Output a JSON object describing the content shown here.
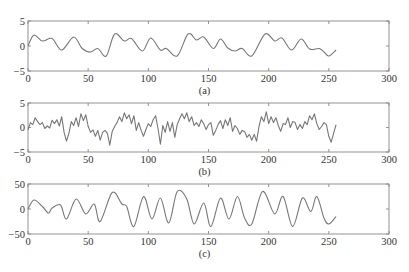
{
  "figure": {
    "line_color": "#777777",
    "frame_color": "#888888",
    "text_color": "#333333"
  },
  "chart_data": [
    {
      "type": "line",
      "title": "",
      "caption": "(a)",
      "xlabel": "",
      "ylabel": "",
      "xlim": [
        0,
        300
      ],
      "ylim": [
        -5,
        5
      ],
      "xticks": [
        0,
        50,
        100,
        150,
        200,
        250,
        300
      ],
      "yticks": [
        -5,
        0,
        5
      ],
      "xtick_labels": [
        "0",
        "50",
        "100",
        "150",
        "200",
        "250",
        "300"
      ],
      "ytick_labels": [
        "−5",
        "0",
        "5"
      ],
      "grid": false,
      "series": [
        {
          "name": "signal (a)",
          "x": [
            0,
            5,
            12,
            20,
            28,
            38,
            45,
            52,
            58,
            65,
            72,
            80,
            86,
            95,
            102,
            110,
            115,
            124,
            133,
            140,
            146,
            154,
            160,
            166,
            172,
            178,
            186,
            197,
            205,
            211,
            219,
            227,
            234,
            242,
            246,
            250,
            256
          ],
          "values": [
            0,
            2.2,
            1.0,
            1.5,
            -0.8,
            1.8,
            -0.5,
            -1.2,
            -0.5,
            -2.0,
            2.4,
            1.0,
            1.5,
            -1.0,
            1.6,
            -0.8,
            -0.5,
            -2.0,
            2.4,
            1.2,
            1.8,
            -0.5,
            1.4,
            -0.4,
            -1.0,
            -0.5,
            -2.0,
            2.4,
            1.0,
            1.6,
            -0.8,
            1.4,
            -0.6,
            -0.5,
            -1.2,
            -2.0,
            -0.8
          ]
        }
      ]
    },
    {
      "type": "line",
      "title": "",
      "caption": "(b)",
      "xlabel": "",
      "ylabel": "",
      "xlim": [
        0,
        300
      ],
      "ylim": [
        -5,
        5
      ],
      "xticks": [
        0,
        50,
        100,
        150,
        200,
        250,
        300
      ],
      "yticks": [
        -5,
        0,
        5
      ],
      "xtick_labels": [
        "0",
        "50",
        "100",
        "150",
        "200",
        "250",
        "300"
      ],
      "ytick_labels": [
        "−5",
        "0",
        "5"
      ],
      "grid": false,
      "series": [
        {
          "name": "noisy signal (b)",
          "x": [
            0,
            2,
            4,
            6,
            8,
            10,
            12,
            14,
            16,
            18,
            20,
            22,
            24,
            26,
            28,
            30,
            32,
            34,
            36,
            38,
            40,
            42,
            44,
            46,
            48,
            50,
            52,
            54,
            56,
            58,
            60,
            62,
            64,
            66,
            68,
            70,
            72,
            74,
            76,
            78,
            80,
            82,
            84,
            86,
            88,
            90,
            92,
            94,
            96,
            98,
            100,
            102,
            104,
            106,
            108,
            110,
            112,
            114,
            116,
            118,
            120,
            122,
            124,
            126,
            128,
            130,
            132,
            134,
            136,
            138,
            140,
            142,
            144,
            146,
            148,
            150,
            152,
            154,
            156,
            158,
            160,
            162,
            164,
            166,
            168,
            170,
            172,
            174,
            176,
            178,
            180,
            182,
            184,
            186,
            188,
            190,
            192,
            194,
            196,
            198,
            200,
            202,
            204,
            206,
            208,
            210,
            212,
            214,
            216,
            218,
            220,
            222,
            224,
            226,
            228,
            230,
            232,
            234,
            236,
            238,
            240,
            242,
            244,
            246,
            248,
            250,
            252,
            254,
            256
          ],
          "values": [
            -0.5,
            1.0,
            0.6,
            2.0,
            1.2,
            0.6,
            1.0,
            -0.2,
            0.3,
            -0.1,
            1.5,
            0.8,
            1.6,
            0.3,
            2.2,
            -1.0,
            -2.8,
            -1.2,
            1.2,
            0.4,
            2.0,
            0.2,
            2.8,
            1.4,
            2.6,
            0.2,
            -1.0,
            -0.5,
            -1.8,
            -0.6,
            -2.6,
            -1.0,
            -0.6,
            -1.2,
            -3.6,
            -0.8,
            0.2,
            1.0,
            2.2,
            1.2,
            3.0,
            1.8,
            2.6,
            0.8,
            2.4,
            -0.6,
            1.0,
            -0.6,
            -1.8,
            -0.4,
            0.8,
            0.2,
            1.6,
            2.4,
            -0.2,
            -3.4,
            0.4,
            -1.0,
            1.2,
            -0.8,
            1.0,
            -2.0,
            0.6,
            1.8,
            2.8,
            1.8,
            3.0,
            1.2,
            2.2,
            0.4,
            1.0,
            0.2,
            1.6,
            0.8,
            -0.4,
            0.6,
            1.0,
            -1.6,
            -0.6,
            0.6,
            1.4,
            -0.2,
            1.6,
            0.4,
            2.0,
            -0.8,
            0.4,
            -0.2,
            -1.4,
            -0.6,
            -0.8,
            -2.0,
            -1.4,
            -2.6,
            -1.4,
            -2.8,
            0.2,
            2.2,
            1.2,
            3.2,
            0.8,
            2.2,
            1.0,
            2.0,
            0.4,
            -0.8,
            0.8,
            0.6,
            2.0,
            0.0,
            1.2,
            1.0,
            -0.4,
            0.6,
            -0.2,
            1.2,
            0.6,
            2.4,
            1.6,
            2.8,
            0.8,
            -0.4,
            0.2,
            1.0,
            0.6,
            -1.8,
            -3.0,
            -1.2,
            0.6
          ]
        }
      ]
    },
    {
      "type": "line",
      "title": "",
      "caption": "(c)",
      "xlabel": "",
      "ylabel": "",
      "xlim": [
        0,
        300
      ],
      "ylim": [
        -50,
        50
      ],
      "xticks": [
        0,
        50,
        100,
        150,
        200,
        250,
        300
      ],
      "yticks": [
        -50,
        0,
        50
      ],
      "xtick_labels": [
        "0",
        "50",
        "100",
        "150",
        "200",
        "250",
        "300"
      ],
      "ytick_labels": [
        "−50",
        "0",
        "50"
      ],
      "grid": false,
      "series": [
        {
          "name": "signal (c)",
          "x": [
            0,
            5,
            12,
            17,
            20,
            27,
            32,
            40,
            48,
            55,
            60,
            70,
            78,
            82,
            88,
            96,
            103,
            110,
            117,
            124,
            132,
            138,
            146,
            152,
            160,
            167,
            174,
            180,
            186,
            195,
            205,
            212,
            220,
            228,
            235,
            240,
            246,
            250,
            256
          ],
          "values": [
            0,
            18,
            5,
            -8,
            2,
            8,
            -20,
            20,
            -10,
            10,
            -25,
            33,
            10,
            5,
            -35,
            25,
            -20,
            22,
            -28,
            35,
            20,
            -30,
            12,
            -35,
            22,
            -20,
            25,
            -18,
            -30,
            35,
            -10,
            25,
            -35,
            22,
            -5,
            25,
            -18,
            -30,
            -15
          ]
        }
      ]
    }
  ]
}
